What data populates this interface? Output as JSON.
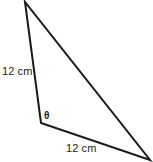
{
  "figure": {
    "type": "geometry-diagram",
    "shape": "triangle",
    "background_color": "#ffffff",
    "stroke_color": "#1a1a1a",
    "stroke_width": 2,
    "vertices": [
      {
        "name": "apex",
        "x": 25,
        "y": 2
      },
      {
        "name": "theta-vertex",
        "x": 41,
        "y": 123
      },
      {
        "name": "right-vertex",
        "x": 150,
        "y": 160
      }
    ],
    "edges": [
      {
        "name": "left-side",
        "from": "apex",
        "to": "theta-vertex",
        "label": "12 cm"
      },
      {
        "name": "bottom-side",
        "from": "theta-vertex",
        "to": "right-vertex",
        "label": "12 cm"
      },
      {
        "name": "hypotenuse",
        "from": "apex",
        "to": "right-vertex",
        "label": ""
      }
    ],
    "labels": {
      "side_left": "12 cm",
      "side_bottom": "12 cm",
      "angle_theta": "θ"
    }
  }
}
